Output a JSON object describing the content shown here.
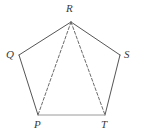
{
  "figure": {
    "kind": "geometry-diagram",
    "shape_name": "pentagon",
    "background_color": "#ffffff",
    "width": 141,
    "height": 135,
    "solid_edge_color": "#555555",
    "base_edge_color": "#9a9a9a",
    "dashed_edge_color": "#6b6b6b",
    "label_color": "#3a3a3a",
    "stroke_width": 1,
    "dash_pattern": "3 2"
  },
  "vertices": [
    {
      "id": "R",
      "label": "R",
      "x": 71,
      "y": 22,
      "label_x": 66,
      "label_y": 3
    },
    {
      "id": "Q",
      "label": "Q",
      "x": 19,
      "y": 55,
      "label_x": 6,
      "label_y": 49
    },
    {
      "id": "S",
      "label": "S",
      "x": 120,
      "y": 55,
      "label_x": 124,
      "label_y": 49
    },
    {
      "id": "P",
      "label": "P",
      "x": 38,
      "y": 115,
      "label_x": 34,
      "label_y": 119
    },
    {
      "id": "T",
      "label": "T",
      "x": 105,
      "y": 115,
      "label_x": 101,
      "label_y": 119
    }
  ],
  "edges": [
    {
      "id": "QR",
      "from": "Q",
      "to": "R",
      "style": "solid",
      "color": "#555555"
    },
    {
      "id": "RS",
      "from": "R",
      "to": "S",
      "style": "solid",
      "color": "#555555"
    },
    {
      "id": "ST",
      "from": "S",
      "to": "T",
      "style": "solid",
      "color": "#555555"
    },
    {
      "id": "TP",
      "from": "T",
      "to": "P",
      "style": "solid",
      "color": "#9a9a9a"
    },
    {
      "id": "PQ",
      "from": "P",
      "to": "Q",
      "style": "solid",
      "color": "#555555"
    }
  ],
  "diagonals": [
    {
      "id": "RP",
      "from": "R",
      "to": "P",
      "style": "dashed",
      "color": "#6b6b6b"
    },
    {
      "id": "RT",
      "from": "R",
      "to": "T",
      "style": "dashed",
      "color": "#6b6b6b"
    }
  ]
}
